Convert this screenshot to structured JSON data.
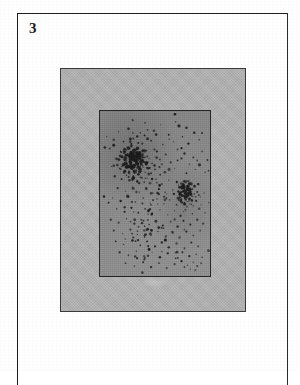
{
  "plate": {
    "number_label": "3",
    "caption": ""
  },
  "colors": {
    "paper": "#fefefe",
    "frame_line": "#2a2a2a",
    "mount_fill": "#b2b2b2",
    "mount_border": "#3a3a3a",
    "panel_fill": "#8d8d8d",
    "panel_border": "#262626",
    "stipple_dot": "#1c1c1c"
  },
  "figure": {
    "kind": "halftone-stipple-plate",
    "outer_mount": {
      "x": 60,
      "y": 68,
      "width": 186,
      "height": 244
    },
    "inner_panel": {
      "x": 98,
      "y": 109,
      "width": 112,
      "height": 167
    }
  },
  "chart_data": {
    "type": "scatter",
    "title": "",
    "xlabel": "",
    "ylabel": "",
    "xlim": [
      0,
      112
    ],
    "ylim": [
      0,
      167
    ],
    "grid": false,
    "legend": null,
    "marker_color": "#1c1c1c",
    "clusters": [
      {
        "name": "primary-cluster",
        "cx": 34,
        "cy": 48,
        "n": 72,
        "spread": 13
      },
      {
        "name": "secondary-cluster",
        "cx": 88,
        "cy": 82,
        "n": 34,
        "spread": 9
      },
      {
        "name": "lower-arc",
        "cx": 52,
        "cy": 118,
        "n": 30,
        "spread": 22
      },
      {
        "name": "sparse-field",
        "cx": 56,
        "cy": 84,
        "n": 90,
        "spread": 46
      }
    ],
    "points": [
      [
        33,
        9
      ],
      [
        46,
        12
      ],
      [
        62,
        14
      ],
      [
        77,
        11
      ],
      [
        88,
        17
      ],
      [
        19,
        21
      ],
      [
        29,
        18
      ],
      [
        41,
        22
      ],
      [
        55,
        20
      ],
      [
        70,
        24
      ],
      [
        84,
        26
      ],
      [
        96,
        22
      ],
      [
        14,
        29
      ],
      [
        24,
        31
      ],
      [
        34,
        28
      ],
      [
        43,
        33
      ],
      [
        52,
        30
      ],
      [
        64,
        34
      ],
      [
        75,
        31
      ],
      [
        90,
        33
      ],
      [
        101,
        29
      ],
      [
        10,
        38
      ],
      [
        21,
        41
      ],
      [
        28,
        37
      ],
      [
        33,
        42
      ],
      [
        37,
        39
      ],
      [
        40,
        44
      ],
      [
        44,
        40
      ],
      [
        48,
        46
      ],
      [
        58,
        41
      ],
      [
        67,
        44
      ],
      [
        79,
        39
      ],
      [
        86,
        43
      ],
      [
        95,
        47
      ],
      [
        104,
        41
      ],
      [
        16,
        48
      ],
      [
        23,
        46
      ],
      [
        27,
        50
      ],
      [
        30,
        45
      ],
      [
        32,
        49
      ],
      [
        34,
        44
      ],
      [
        36,
        48
      ],
      [
        38,
        43
      ],
      [
        39,
        50
      ],
      [
        41,
        46
      ],
      [
        43,
        51
      ],
      [
        45,
        47
      ],
      [
        47,
        52
      ],
      [
        50,
        48
      ],
      [
        53,
        53
      ],
      [
        61,
        49
      ],
      [
        72,
        52
      ],
      [
        83,
        48
      ],
      [
        91,
        54
      ],
      [
        99,
        50
      ],
      [
        12,
        56
      ],
      [
        20,
        58
      ],
      [
        25,
        54
      ],
      [
        28,
        57
      ],
      [
        31,
        53
      ],
      [
        33,
        58
      ],
      [
        35,
        55
      ],
      [
        37,
        60
      ],
      [
        39,
        56
      ],
      [
        42,
        61
      ],
      [
        44,
        57
      ],
      [
        46,
        62
      ],
      [
        49,
        58
      ],
      [
        52,
        63
      ],
      [
        56,
        59
      ],
      [
        66,
        62
      ],
      [
        76,
        58
      ],
      [
        88,
        63
      ],
      [
        97,
        59
      ],
      [
        107,
        62
      ],
      [
        15,
        66
      ],
      [
        22,
        69
      ],
      [
        27,
        65
      ],
      [
        30,
        70
      ],
      [
        34,
        66
      ],
      [
        38,
        71
      ],
      [
        41,
        67
      ],
      [
        45,
        72
      ],
      [
        48,
        68
      ],
      [
        51,
        73
      ],
      [
        57,
        69
      ],
      [
        63,
        74
      ],
      [
        70,
        70
      ],
      [
        80,
        75
      ],
      [
        90,
        71
      ],
      [
        100,
        74
      ],
      [
        18,
        78
      ],
      [
        26,
        81
      ],
      [
        33,
        77
      ],
      [
        40,
        82
      ],
      [
        47,
        78
      ],
      [
        54,
        83
      ],
      [
        60,
        79
      ],
      [
        68,
        84
      ],
      [
        74,
        80
      ],
      [
        81,
        85
      ],
      [
        85,
        81
      ],
      [
        88,
        86
      ],
      [
        90,
        80
      ],
      [
        92,
        85
      ],
      [
        94,
        79
      ],
      [
        96,
        84
      ],
      [
        99,
        82
      ],
      [
        102,
        87
      ],
      [
        106,
        83
      ],
      [
        13,
        88
      ],
      [
        21,
        91
      ],
      [
        29,
        87
      ],
      [
        36,
        92
      ],
      [
        44,
        88
      ],
      [
        51,
        93
      ],
      [
        58,
        89
      ],
      [
        65,
        94
      ],
      [
        71,
        90
      ],
      [
        78,
        95
      ],
      [
        83,
        89
      ],
      [
        86,
        93
      ],
      [
        89,
        88
      ],
      [
        91,
        94
      ],
      [
        93,
        90
      ],
      [
        95,
        96
      ],
      [
        98,
        91
      ],
      [
        103,
        95
      ],
      [
        17,
        99
      ],
      [
        25,
        102
      ],
      [
        32,
        98
      ],
      [
        39,
        103
      ],
      [
        46,
        99
      ],
      [
        53,
        104
      ],
      [
        61,
        100
      ],
      [
        69,
        105
      ],
      [
        76,
        101
      ],
      [
        82,
        106
      ],
      [
        87,
        100
      ],
      [
        94,
        104
      ],
      [
        101,
        99
      ],
      [
        107,
        103
      ],
      [
        11,
        110
      ],
      [
        19,
        113
      ],
      [
        27,
        109
      ],
      [
        35,
        114
      ],
      [
        42,
        110
      ],
      [
        50,
        115
      ],
      [
        57,
        111
      ],
      [
        64,
        116
      ],
      [
        72,
        112
      ],
      [
        79,
        117
      ],
      [
        85,
        111
      ],
      [
        92,
        115
      ],
      [
        99,
        110
      ],
      [
        105,
        114
      ],
      [
        14,
        121
      ],
      [
        23,
        124
      ],
      [
        31,
        120
      ],
      [
        38,
        125
      ],
      [
        45,
        121
      ],
      [
        52,
        126
      ],
      [
        59,
        122
      ],
      [
        67,
        127
      ],
      [
        74,
        123
      ],
      [
        81,
        128
      ],
      [
        88,
        122
      ],
      [
        95,
        126
      ],
      [
        102,
        121
      ],
      [
        16,
        132
      ],
      [
        24,
        135
      ],
      [
        33,
        131
      ],
      [
        41,
        136
      ],
      [
        48,
        132
      ],
      [
        56,
        137
      ],
      [
        63,
        133
      ],
      [
        70,
        138
      ],
      [
        78,
        134
      ],
      [
        86,
        139
      ],
      [
        93,
        133
      ],
      [
        100,
        137
      ],
      [
        20,
        143
      ],
      [
        29,
        146
      ],
      [
        37,
        142
      ],
      [
        45,
        147
      ],
      [
        53,
        143
      ],
      [
        61,
        148
      ],
      [
        69,
        144
      ],
      [
        77,
        149
      ],
      [
        84,
        143
      ],
      [
        91,
        147
      ],
      [
        98,
        145
      ],
      [
        104,
        148
      ],
      [
        26,
        154
      ],
      [
        35,
        157
      ],
      [
        44,
        153
      ],
      [
        52,
        158
      ],
      [
        60,
        154
      ],
      [
        68,
        159
      ],
      [
        76,
        155
      ],
      [
        83,
        152
      ],
      [
        89,
        156
      ],
      [
        95,
        153
      ],
      [
        99,
        157
      ],
      [
        103,
        154
      ],
      [
        86,
        158
      ],
      [
        92,
        160
      ],
      [
        97,
        161
      ]
    ]
  }
}
